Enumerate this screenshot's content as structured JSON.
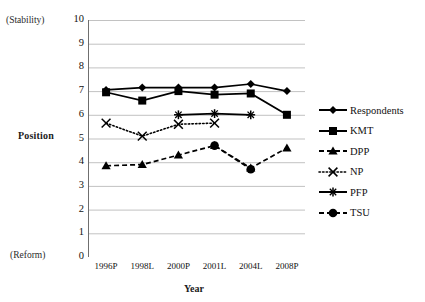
{
  "chart_data": {
    "type": "line",
    "title": "",
    "xlabel": "Year",
    "ylabel": "Position",
    "ylim": [
      0,
      10
    ],
    "ytick_step": 1,
    "grid": true,
    "legend_position": "right",
    "axis_annotations": {
      "y_top": "(Stability)",
      "y_bottom": "(Reform)"
    },
    "categories": [
      "1996P",
      "1998L",
      "2000P",
      "2001L",
      "2004L",
      "2008P"
    ],
    "yticks": [
      "10",
      "9",
      "8",
      "7",
      "6",
      "5",
      "4",
      "3",
      "2",
      "1",
      "0"
    ],
    "series": [
      {
        "name": "Respondents",
        "marker": "diamond",
        "line": "solid",
        "color": "#000000",
        "values": [
          7.05,
          7.15,
          7.15,
          7.15,
          7.3,
          7.0
        ]
      },
      {
        "name": "KMT",
        "marker": "square",
        "line": "solid",
        "color": "#000000",
        "values": [
          6.95,
          6.6,
          7.0,
          6.85,
          6.9,
          6.0
        ]
      },
      {
        "name": "DPP",
        "marker": "triangle",
        "line": "dashed",
        "color": "#000000",
        "values": [
          3.85,
          3.9,
          4.3,
          4.7,
          3.75,
          4.6
        ]
      },
      {
        "name": "NP",
        "marker": "x",
        "line": "dotted",
        "color": "#000000",
        "values": [
          5.65,
          5.1,
          5.6,
          5.65,
          null,
          null
        ]
      },
      {
        "name": "PFP",
        "marker": "star",
        "line": "solid",
        "color": "#000000",
        "values": [
          null,
          null,
          6.0,
          6.05,
          6.0,
          null
        ]
      },
      {
        "name": "TSU",
        "marker": "circle",
        "line": "dashed",
        "color": "#000000",
        "values": [
          null,
          null,
          null,
          4.7,
          3.7,
          null
        ]
      }
    ]
  }
}
